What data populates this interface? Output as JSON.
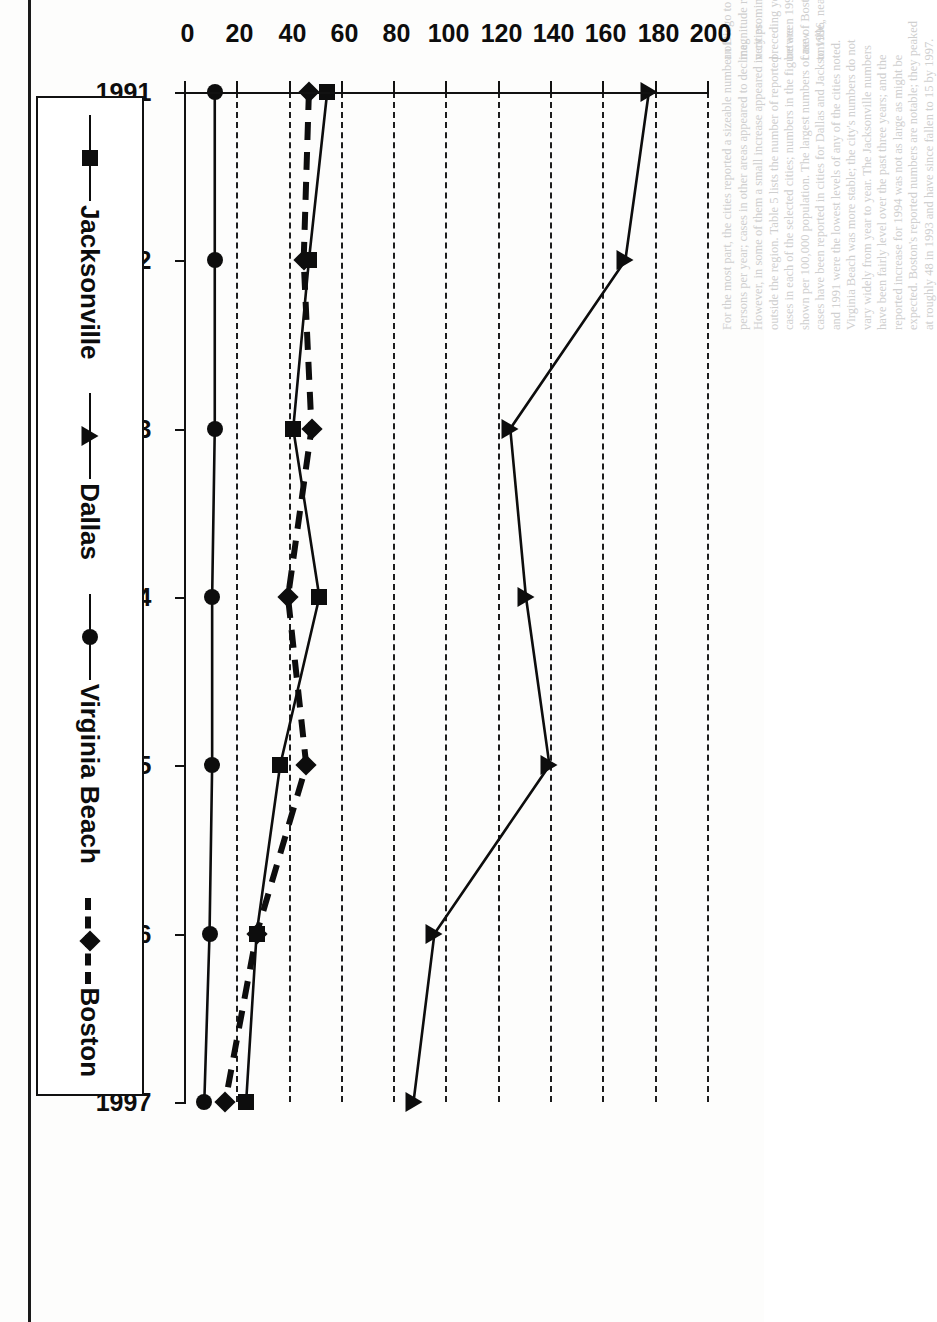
{
  "figure": {
    "orientation": "rotated-90-clockwise-on-page",
    "legend_position": "bottom-of-figure (right side of page)",
    "ink_color": "#0d0d0d",
    "background_color": "#ffffff"
  },
  "chart_data": {
    "type": "line",
    "title": "",
    "subtitle": "",
    "xlabel": "",
    "ylabel": "",
    "grid": true,
    "legend_position": "bottom",
    "categories": [
      "1991",
      "1992",
      "1993",
      "1994",
      "1995",
      "1996",
      "1997"
    ],
    "x": [
      "1991",
      "1992",
      "1993",
      "1994",
      "1995",
      "1996",
      "1997"
    ],
    "ylim": [
      0,
      200
    ],
    "yticks": [
      "0",
      "20",
      "40",
      "60",
      "80",
      "100",
      "120",
      "140",
      "160",
      "180",
      "200"
    ],
    "ytick_values": [
      0,
      20,
      40,
      60,
      80,
      100,
      120,
      140,
      160,
      180,
      200
    ],
    "xticks": [
      "1991",
      "1992",
      "1993",
      "1994",
      "1995",
      "1996",
      "1997"
    ],
    "series": [
      {
        "name": "Boston",
        "marker": "diamond",
        "line_style": "dashed",
        "values": [
          47,
          45,
          48,
          39,
          46,
          27,
          15
        ]
      },
      {
        "name": "Virginia Beach",
        "marker": "circle",
        "line_style": "solid",
        "values": [
          11,
          11,
          11,
          10,
          10,
          9,
          7
        ]
      },
      {
        "name": "Dallas",
        "marker": "triangle",
        "line_style": "solid",
        "values": [
          177,
          168,
          124,
          130,
          139,
          95,
          87
        ]
      },
      {
        "name": "Jacksonville",
        "marker": "square",
        "line_style": "solid",
        "values": [
          54,
          47,
          41,
          51,
          36,
          27,
          23
        ]
      }
    ]
  },
  "legend": {
    "entries": [
      {
        "label": "Boston",
        "marker": "diamond",
        "line_style": "dashed"
      },
      {
        "label": "Virginia Beach",
        "marker": "circle",
        "line_style": "solid"
      },
      {
        "label": "Dallas",
        "marker": "triangle",
        "line_style": "solid"
      },
      {
        "label": "Jacksonville",
        "marker": "square",
        "line_style": "solid"
      }
    ]
  },
  "page_background_text": {
    "columns": [
      "an Diego to New Orleans. Of example shows a variable-",
      "magnitude repeating in June 1994. Boston, although still",
      "very prominent, decreased 22% in 1996 and 1997 from the",
      "preceding year. All of the reporting cities showed a decline",
      "between 1996 and 1997, but the decrease is greatest in the",
      "case of Boston. AIDS cases decreased in 1997 as compared",
      "to 1996, nearly 40% lower than the 1996 level of 44,000."
    ],
    "columns2": [
      "For the most part, the cities reported a sizeable number of",
      "persons per year; cases in other areas appeared to decline.",
      "However, in some of them a small increase appeared in cities",
      "outside the region. Table 5 lists the number of reported",
      "cases in each of the selected cities; numbers in the figure are",
      "shown per 100,000 population. The largest numbers of new",
      "cases have been reported in cities for Dallas and Jacksonville,",
      "and 1991 were the lowest levels of any of the cities noted.",
      "Virginia Beach was more stable; the city's numbers do not",
      "vary widely from year to year. The Jacksonville numbers",
      "have been fairly level over the past three years; and the",
      "reported increase for 1994 was not as large as might be",
      "expected. Boston's reported numbers are notable; they peaked",
      "at roughly 48 in 1993 and have since fallen to 15 by 1997."
    ]
  }
}
